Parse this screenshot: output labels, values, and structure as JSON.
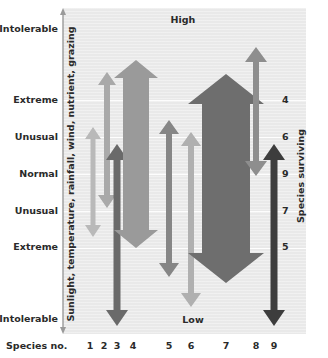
{
  "diagram": {
    "top_label": "High",
    "bottom_label": "Low",
    "left_axis_title": "Sunlight, temperature, rainfall, wind, nutrient, grazing",
    "right_axis_title": "Species surviving",
    "species_axis_title": "Species no.",
    "tolerance_levels": [
      {
        "label": "Intolerable",
        "y": 29
      },
      {
        "label": "Extreme",
        "y": 100
      },
      {
        "label": "Unusual",
        "y": 137
      },
      {
        "label": "Normal",
        "y": 174
      },
      {
        "label": "Unusual",
        "y": 211
      },
      {
        "label": "Extreme",
        "y": 247
      },
      {
        "label": "Intolerable",
        "y": 319
      }
    ],
    "species_surviving": [
      {
        "level": "Extreme (high)",
        "count": "4",
        "y": 100
      },
      {
        "level": "Unusual (high)",
        "count": "6",
        "y": 137
      },
      {
        "level": "Normal",
        "count": "9",
        "y": 174
      },
      {
        "level": "Unusual (low)",
        "count": "7",
        "y": 211
      },
      {
        "level": "Extreme (low)",
        "count": "5",
        "y": 247
      }
    ],
    "species": [
      {
        "no": "1",
        "label_x": 90,
        "x": 93,
        "top": 127,
        "bottom": 237,
        "shaft": 5,
        "head": 16,
        "head_len": 12,
        "double": true,
        "color": "#b9b9b9"
      },
      {
        "no": "2",
        "label_x": 104,
        "x": 107,
        "top": 72,
        "bottom": 208,
        "shaft": 6,
        "head": 18,
        "head_len": 13,
        "double": true,
        "color": "#a9a9a9"
      },
      {
        "no": "3",
        "label_x": 117,
        "x": 117,
        "top": 144,
        "bottom": 326,
        "shaft": 7,
        "head": 22,
        "head_len": 16,
        "double": true,
        "color": "#6a6a6a"
      },
      {
        "no": "4",
        "label_x": 133,
        "x": 136,
        "top": 60,
        "bottom": 248,
        "shaft": 26,
        "head": 44,
        "head_len": 18,
        "double": true,
        "color": "#9a9a9a"
      },
      {
        "no": "5",
        "label_x": 169,
        "x": 169,
        "top": 120,
        "bottom": 277,
        "shaft": 6,
        "head": 20,
        "head_len": 14,
        "double": true,
        "color": "#868686"
      },
      {
        "no": "6",
        "label_x": 191,
        "x": 191,
        "top": 132,
        "bottom": 307,
        "shaft": 6,
        "head": 20,
        "head_len": 14,
        "double": true,
        "color": "#b0b0b0"
      },
      {
        "no": "7",
        "label_x": 226,
        "x": 226,
        "top": 74,
        "bottom": 283,
        "shaft": 48,
        "head": 76,
        "head_len": 30,
        "double": true,
        "color": "#6e6e6e"
      },
      {
        "no": "8",
        "label_x": 256,
        "x": 256,
        "top": 47,
        "bottom": 176,
        "shaft": 6,
        "head": 22,
        "head_len": 15,
        "double": true,
        "color": "#8e8e8e"
      },
      {
        "no": "9",
        "label_x": 274,
        "x": 274,
        "top": 144,
        "bottom": 326,
        "shaft": 7,
        "head": 22,
        "head_len": 16,
        "double": true,
        "color": "#3d3d3d"
      }
    ],
    "colors": {
      "plot_background": "#e9e9e9",
      "axis_line": "#9a9a9a",
      "text": "#2a2a2a"
    }
  }
}
